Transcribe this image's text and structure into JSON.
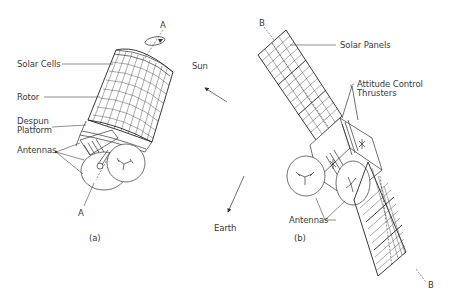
{
  "figure_a": {
    "caption": "(a)",
    "axis_label_top": "A",
    "axis_label_bottom": "A",
    "labels": {
      "solar_cells": "Solar Cells",
      "rotor": "Rotor",
      "despun_line1": "Despun",
      "despun_line2": "Platform",
      "antennas": "Antennas"
    }
  },
  "figure_b": {
    "caption": "(b)",
    "axis_label_top": "B",
    "axis_label_bottom": "B",
    "labels": {
      "solar_panels": "Solar Panels",
      "thrusters_line1": "Attitude Control",
      "thrusters_line2": "Thrusters",
      "antennas": "Antennas"
    }
  },
  "directions": {
    "sun": "Sun",
    "earth": "Earth"
  },
  "colors": {
    "line": "#333333",
    "text": "#3a3a3a",
    "background": "#ffffff"
  }
}
